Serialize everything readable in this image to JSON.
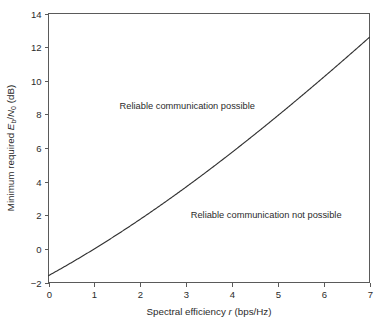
{
  "chart_data": {
    "type": "line",
    "title": "",
    "xlabel": "Spectral efficiency r (bps/Hz)",
    "ylabel": "Minimum required Eb/N0 (dB)",
    "xlim": [
      0,
      7
    ],
    "ylim": [
      -2,
      14
    ],
    "grid": false,
    "legend": "none",
    "xticks": [
      "0",
      "1",
      "2",
      "3",
      "4",
      "5",
      "6",
      "7"
    ],
    "xtick_values": [
      0,
      1,
      2,
      3,
      4,
      5,
      6,
      7
    ],
    "yticks": [
      "-2",
      "0",
      "2",
      "4",
      "6",
      "8",
      "10",
      "12",
      "14"
    ],
    "ytick_values": [
      -2,
      0,
      2,
      4,
      6,
      8,
      10,
      12,
      14
    ],
    "series": [
      {
        "name": "Shannon limit",
        "formula": "10*log10((2^r - 1)/r)",
        "x": [
          0.0,
          0.1,
          0.2,
          0.3,
          0.4,
          0.5,
          0.6,
          0.7,
          0.8,
          0.9,
          1.0,
          1.2,
          1.4,
          1.6,
          1.8,
          2.0,
          2.2,
          2.4,
          2.6,
          2.8,
          3.0,
          3.2,
          3.4,
          3.6,
          3.8,
          4.0,
          4.2,
          4.4,
          4.6,
          4.8,
          5.0,
          5.2,
          5.4,
          5.6,
          5.8,
          6.0,
          6.2,
          6.4,
          6.6,
          6.8,
          7.0
        ],
        "y": [
          -1.59,
          -1.44,
          -1.29,
          -1.13,
          -0.98,
          -0.82,
          -0.66,
          -0.5,
          -0.33,
          -0.17,
          0.0,
          0.35,
          0.71,
          1.08,
          1.46,
          1.85,
          2.25,
          2.66,
          3.08,
          3.51,
          3.95,
          4.4,
          4.86,
          5.33,
          5.8,
          6.28,
          6.77,
          7.26,
          7.76,
          8.26,
          8.76,
          9.27,
          9.78,
          10.3,
          10.82,
          11.34,
          11.86,
          12.39,
          12.92,
          13.45,
          12.57
        ]
      }
    ],
    "annotations": [
      {
        "name": "reliable-region-label",
        "text": "Reliable communication possible",
        "x": 1.55,
        "y": 8.3
      },
      {
        "name": "not-reliable-region-label",
        "text": "Reliable communication not possible",
        "x": 3.1,
        "y": 1.85
      }
    ],
    "colors": {
      "curve": "#333333",
      "axis": "#5a5a5a",
      "text": "#2b2b2b",
      "background": "#ffffff"
    }
  },
  "axis": {
    "x_title_plain": "Spectral efficiency",
    "x_title_var": "r",
    "x_title_unit": "(bps/Hz)",
    "y_title_plain": "Minimum required",
    "y_title_var_e": "E",
    "y_title_sub_b": "b",
    "y_title_slash": "/",
    "y_title_var_n": "N",
    "y_title_sub_0": "0",
    "y_title_unit": "(dB)"
  },
  "ticks": {
    "x": [
      "0",
      "1",
      "2",
      "3",
      "4",
      "5",
      "6",
      "7"
    ],
    "y": [
      "14",
      "12",
      "10",
      "8",
      "6",
      "4",
      "2",
      "0",
      "-2"
    ]
  },
  "annotations": {
    "upper": "Reliable communication possible",
    "lower": "Reliable communication not possible"
  }
}
